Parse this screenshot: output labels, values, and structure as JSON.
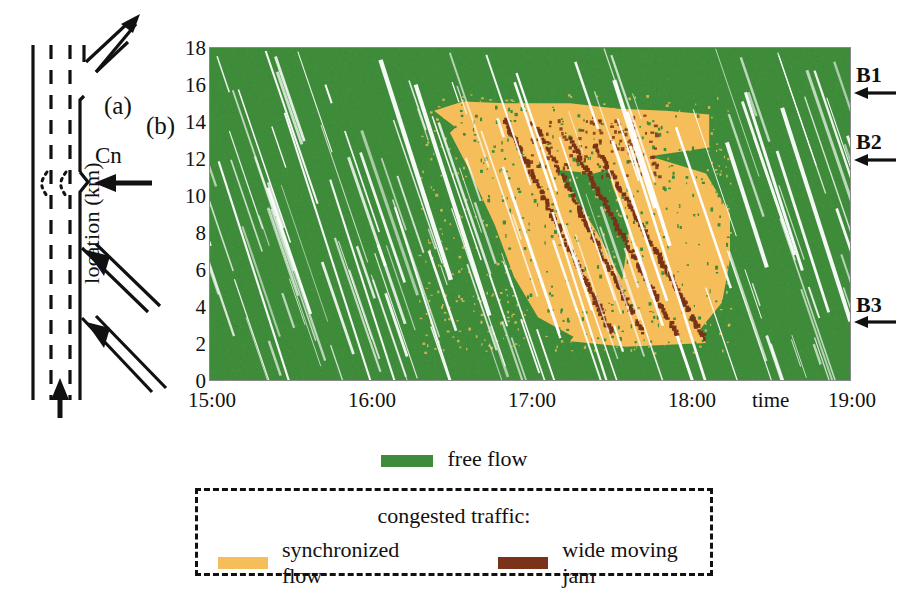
{
  "figure": {
    "panel_a_label": "(a)",
    "panel_b_label": "(b)",
    "bottleneck_label": "Cn"
  },
  "chart_data": {
    "type": "heatmap",
    "title": "",
    "xlabel": "time",
    "ylabel": "location (km)",
    "xlim": [
      "15:00",
      "19:00"
    ],
    "ylim": [
      0,
      18
    ],
    "xticks": [
      "15:00",
      "16:00",
      "17:00",
      "18:00",
      "19:00"
    ],
    "yticks": [
      0,
      2,
      4,
      6,
      8,
      10,
      12,
      14,
      16,
      18
    ],
    "grid": false,
    "legend_position": "below",
    "categories": [
      "free flow",
      "synchronized flow",
      "wide moving jam"
    ],
    "colors": {
      "free_flow": "#3e8c3a",
      "synchronized_flow": "#f5be5a",
      "wide_moving_jam": "#7a3318",
      "no_data": "#ffffff"
    },
    "bottleneck_markers": [
      {
        "name": "B1",
        "location_km": 15.8
      },
      {
        "name": "B2",
        "location_km": 12.2
      },
      {
        "name": "B3",
        "location_km": 3.2
      }
    ],
    "regions": [
      {
        "class": "synchronized flow",
        "description": "congested pattern upstream of bottleneck B1, onset ~16:35, dissolving ~18:10",
        "time_start": "16:35",
        "time_end": "18:10",
        "location_start_km": 15.0,
        "location_end_km": 2.0
      }
    ],
    "jam_lines": [
      {
        "class": "wide moving jam",
        "start": {
          "time": "16:50",
          "km": 14.2
        },
        "end": {
          "time": "17:30",
          "km": 2.6
        }
      },
      {
        "class": "wide moving jam",
        "start": {
          "time": "17:02",
          "km": 13.8
        },
        "end": {
          "time": "17:42",
          "km": 2.5
        }
      },
      {
        "class": "wide moving jam",
        "start": {
          "time": "17:14",
          "km": 13.2
        },
        "end": {
          "time": "17:55",
          "km": 2.4
        }
      },
      {
        "class": "wide moving jam",
        "start": {
          "time": "17:24",
          "km": 12.8
        },
        "end": {
          "time": "18:05",
          "km": 2.3
        }
      }
    ]
  },
  "legend": {
    "free_flow": "free flow",
    "congested_title": "congested traffic:",
    "synchronized_flow": "synchronized flow",
    "wide_moving_jam": "wide moving jam"
  }
}
